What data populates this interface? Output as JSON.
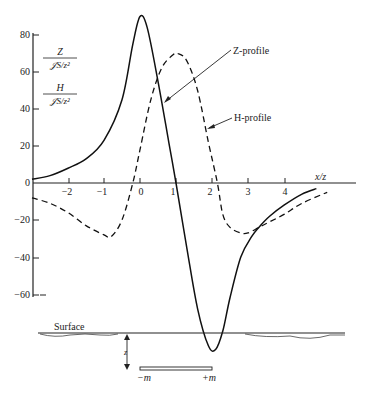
{
  "chart_data": {
    "type": "line",
    "title": "",
    "xlabel": "x/z",
    "ylabel_top": {
      "numerator": "Z",
      "denominator": "𝒥S/z²"
    },
    "ylabel_bottom": {
      "numerator": "H",
      "denominator": "𝒥S/z²"
    },
    "xlim": [
      -3,
      5.5
    ],
    "ylim": [
      -60,
      80
    ],
    "xticks": [
      "-2",
      "-1",
      "0",
      "1",
      "2",
      "3",
      "4"
    ],
    "yticks": [
      "80",
      "60",
      "40",
      "20",
      "0",
      "-20",
      "-40",
      "-60"
    ],
    "grid": false,
    "series": [
      {
        "name": "Z-profile",
        "style": "solid",
        "x": [
          -3.0,
          -2.5,
          -2.0,
          -1.5,
          -1.0,
          -0.5,
          -0.2,
          0.0,
          0.2,
          0.5,
          0.8,
          1.0,
          1.3,
          1.6,
          1.9,
          2.1,
          2.3,
          2.5,
          2.8,
          3.1,
          3.3,
          3.6,
          4.0,
          4.5,
          4.9
        ],
        "y": [
          2,
          4,
          8,
          13,
          23,
          45,
          75,
          90,
          84,
          55,
          22,
          0,
          -35,
          -68,
          -88,
          -90,
          -80,
          -62,
          -40,
          -29,
          -24,
          -18,
          -12,
          -6,
          -3
        ]
      },
      {
        "name": "H-profile",
        "style": "dashed",
        "x": [
          -3.0,
          -2.5,
          -2.0,
          -1.5,
          -1.0,
          -0.8,
          -0.5,
          -0.2,
          0.0,
          0.3,
          0.6,
          0.9,
          1.05,
          1.3,
          1.6,
          1.9,
          2.15,
          2.3,
          2.5,
          2.8,
          3.0,
          3.3,
          3.6,
          4.0,
          4.5,
          5.2
        ],
        "y": [
          -8,
          -11,
          -16,
          -23,
          -28,
          -29,
          -20,
          0,
          18,
          45,
          62,
          69,
          70,
          66,
          50,
          22,
          0,
          -17,
          -24,
          -27,
          -27,
          -24,
          -21,
          -17,
          -11,
          -5
        ]
      }
    ],
    "annotations": [
      {
        "text": "Z-profile",
        "points_to": "Z-profile"
      },
      {
        "text": "H-profile",
        "points_to": "H-profile"
      }
    ],
    "schematic": {
      "surface_label": "Surface",
      "depth_label": "z",
      "pole_neg_label": "−m",
      "pole_pos_label": "+m"
    }
  },
  "labels": {
    "xlabel": "x/z",
    "z_num": "Z",
    "z_den": "𝒥S/z²",
    "h_num": "H",
    "h_den": "𝒥S/z²",
    "z_profile": "Z-profile",
    "h_profile": "H-profile",
    "surface": "Surface",
    "depth": "z",
    "neg_pole": "−m",
    "pos_pole": "+m"
  },
  "ticks": {
    "x": [
      "−2",
      "−1",
      "0",
      "1",
      "2",
      "3",
      "4"
    ],
    "y": [
      "80",
      "60",
      "40",
      "20",
      "0",
      "−20",
      "−40",
      "−60"
    ]
  }
}
